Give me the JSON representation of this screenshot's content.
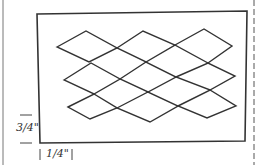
{
  "diagram": {
    "title": "",
    "labels": {
      "vertical_margin": "3/4\"",
      "horizontal_margin": "1/4\""
    },
    "shape": "rectangle-with-diamond-lattice",
    "lattice": {
      "rows": 3,
      "diamonds_per_row": 3
    },
    "colors": {
      "stroke": "#333333",
      "background": "#ffffff"
    }
  }
}
